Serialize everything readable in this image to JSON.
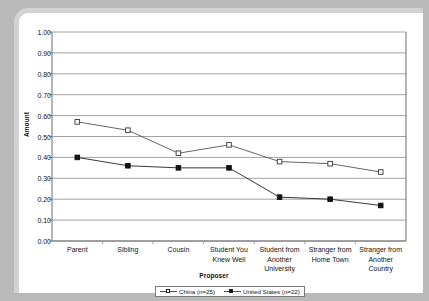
{
  "chart_data": {
    "type": "line",
    "title": "",
    "xlabel": "Proposer",
    "ylabel": "Amount",
    "ylim": [
      0.0,
      1.0
    ],
    "ytick_step": 0.1,
    "grid": true,
    "legend_position": "bottom",
    "categories": [
      "Parent",
      "Sibling",
      "Cousin",
      "Student You Knew Well",
      "Student from Another University",
      "Stranger from Home Town",
      "Stranger from Another Country"
    ],
    "category_lines": [
      [
        "Parent"
      ],
      [
        "Sibling"
      ],
      [
        "Cousin"
      ],
      [
        "Student You",
        "Knew Well"
      ],
      [
        "Student from",
        "Another",
        "University"
      ],
      [
        "Stranger from",
        "Home Town"
      ],
      [
        "Stranger from",
        "Another",
        "Country"
      ]
    ],
    "ytick_labels": [
      "1.00",
      "0.90",
      "0.80",
      "0.70",
      "0.60",
      "0.50",
      "0.40",
      "0.30",
      "0.20",
      "0.10",
      "0.00"
    ],
    "ytick_values": [
      1.0,
      0.9,
      0.8,
      0.7,
      0.6,
      0.5,
      0.4,
      0.3,
      0.2,
      0.1,
      0.0
    ],
    "series": [
      {
        "name": "China (n=25)",
        "marker": "open-square",
        "color": "#555555",
        "values": [
          0.57,
          0.53,
          0.42,
          0.46,
          0.38,
          0.37,
          0.33
        ]
      },
      {
        "name": "United States (n=22)",
        "marker": "filled-square",
        "color": "#222222",
        "values": [
          0.4,
          0.36,
          0.35,
          0.35,
          0.21,
          0.2,
          0.17
        ]
      }
    ]
  },
  "legend": {
    "entries": [
      {
        "label": "China (n=25)"
      },
      {
        "label": "United States (n=22)"
      }
    ]
  }
}
